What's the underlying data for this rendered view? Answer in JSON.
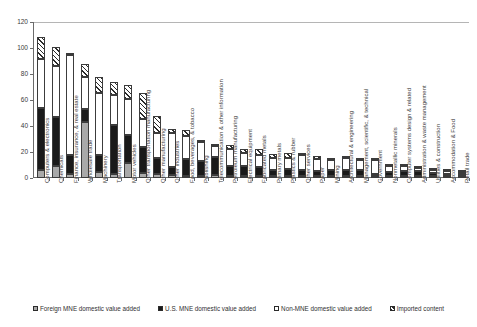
{
  "chart_data": {
    "type": "bar",
    "stacked": true,
    "title": "",
    "xlabel": "",
    "ylabel": "",
    "ylim": [
      0,
      120
    ],
    "ytick_values": [
      0,
      20,
      40,
      60,
      80,
      100,
      120
    ],
    "ytick_labels": [
      "0",
      "20",
      "40",
      "60",
      "80",
      "100",
      "120"
    ],
    "grid": false,
    "legend_position": "bottom",
    "categories": [
      "Computers & electronics",
      "Chemicals",
      "Finance, insurance, & real estate",
      "Wholesale trade",
      "Machinery",
      "Transportation",
      "Motor vehicles",
      "Other transportation manufacturing",
      "Other manufacturing",
      "Other industries",
      "Food, beverages, & tobacco",
      "Publishing",
      "Telecommunication & other information",
      "Petroleum manufacturing",
      "Electrical equipment",
      "Fabricated metals",
      "Primary metals",
      "Plastics & rubber",
      "Other services",
      "Paper",
      "Mining",
      "Architectural & engineering",
      "Management, scientific, & technical",
      "Government",
      "Nonmetallic minerals",
      "Computer systems design & related",
      "Administration & waste management",
      "Utilities & construction",
      "Accommodation & Food",
      "Retail trade"
    ],
    "series": [
      {
        "name": "Foreign MNE domestic value added",
        "color": "#a9a9a9",
        "values": [
          6.0,
          9.5,
          3.0,
          43.0,
          4.5,
          3.0,
          11.5,
          3.5,
          3.0,
          2.0,
          1.5,
          1.0,
          2.0,
          1.5,
          1.5,
          1.5,
          1.5,
          1.5,
          1.0,
          1.5,
          1.5,
          1.0,
          1.0,
          0.5,
          1.0,
          0.5,
          0.5,
          0.5,
          0.5,
          0.5
        ]
      },
      {
        "name": "U.S. MNE domestic value added",
        "color": "#1a1a1a",
        "values": [
          48.0,
          37.5,
          15.0,
          10.0,
          13.5,
          38.0,
          21.5,
          20.5,
          12.5,
          6.5,
          13.0,
          11.5,
          14.0,
          7.5,
          7.5,
          7.0,
          5.0,
          5.5,
          4.5,
          4.0,
          4.5,
          5.0,
          4.5,
          0.5,
          3.0,
          4.0,
          3.5,
          2.0,
          1.0,
          1.5
        ]
      },
      {
        "name": "Non-MNE domestic value added",
        "color": "#ffffff",
        "values": [
          37.5,
          39.0,
          76.5,
          24.5,
          47.5,
          23.0,
          27.5,
          21.5,
          19.5,
          26.5,
          18.0,
          14.5,
          9.0,
          13.0,
          10.0,
          9.5,
          8.5,
          8.5,
          12.0,
          9.0,
          8.0,
          8.5,
          7.5,
          11.0,
          5.0,
          3.5,
          3.0,
          2.5,
          2.0,
          1.5
        ]
      },
      {
        "name": "Imported content",
        "color": "#2b2b2b",
        "hatch": "diagonal",
        "values": [
          17.0,
          15.0,
          2.0,
          10.5,
          12.5,
          10.0,
          11.0,
          20.0,
          12.5,
          3.0,
          4.5,
          2.0,
          0.5,
          3.5,
          3.5,
          4.5,
          3.5,
          3.5,
          0.5,
          2.5,
          1.5,
          0.5,
          0.5,
          0.5,
          0.5,
          0.5,
          0.5,
          0.5,
          0.5,
          0.5
        ]
      }
    ],
    "totals": [
      108.5,
      101.0,
      96.5,
      88.0,
      78.0,
      74.0,
      71.5,
      65.5,
      47.5,
      38.0,
      37.0,
      29.0,
      25.5,
      25.5,
      22.5,
      22.5,
      18.5,
      19.0,
      18.0,
      17.0,
      15.5,
      15.0,
      13.5,
      12.5,
      9.5,
      8.5,
      7.5,
      5.5,
      4.0,
      4.0
    ],
    "legend": [
      "Foreign MNE domestic value added",
      "U.S. MNE domestic value added",
      "Non-MNE domestic value added",
      "Imported content"
    ]
  }
}
